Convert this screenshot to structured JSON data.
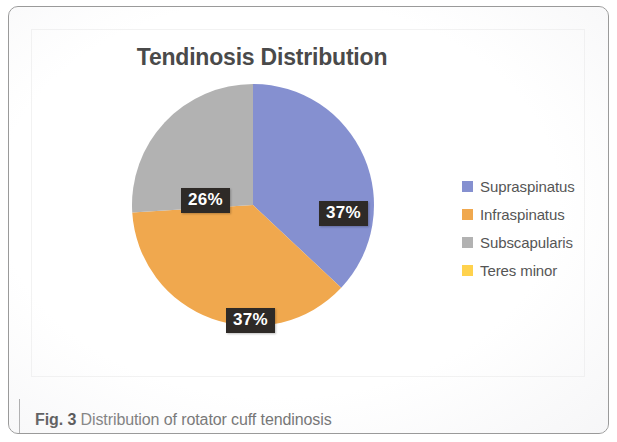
{
  "figure": {
    "caption_figure_number": "Fig. 3",
    "caption_text": "Distribution of rotator cuff tendinosis"
  },
  "chart": {
    "title": "Tendinosis Distribution"
  },
  "legend": {
    "items": [
      {
        "label": "Supraspinatus",
        "color": "#8590d0"
      },
      {
        "label": "Infraspinatus",
        "color": "#f0a84e"
      },
      {
        "label": "Subscapularis",
        "color": "#b2b2b2"
      },
      {
        "label": "Teres minor",
        "color": "#ffd24d"
      }
    ]
  },
  "labels": {
    "supraspinatus": "37%",
    "infraspinatus": "37%",
    "subscapularis": "26%"
  },
  "chart_data": {
    "type": "pie",
    "title": "Tendinosis Distribution",
    "categories": [
      "Supraspinatus",
      "Infraspinatus",
      "Subscapularis",
      "Teres minor"
    ],
    "values": [
      37,
      37,
      26,
      0
    ],
    "value_labels": [
      "37%",
      "37%",
      "26%",
      ""
    ],
    "unit": "percent",
    "colors": [
      "#8590d0",
      "#f0a84e",
      "#b2b2b2",
      "#ffd24d"
    ],
    "start_angle_deg": 0,
    "direction": "clockwise",
    "legend_position": "right",
    "grid": false,
    "xlabel": "",
    "ylabel": ""
  }
}
